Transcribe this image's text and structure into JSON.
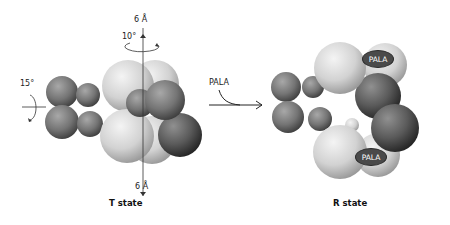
{
  "figure": {
    "t_state": {
      "caption": "T state",
      "top_translation_label": "6 Å",
      "bottom_translation_label": "6 Å",
      "vertical_rotation_label": "10°",
      "horizontal_rotation_label": "15°"
    },
    "transition": {
      "ligand_label": "PALA"
    },
    "r_state": {
      "caption": "R state",
      "bound_ligands": [
        "PALA",
        "PALA"
      ]
    },
    "colors": {
      "catalytic_light": "#d8d8d8",
      "regulatory_dark": "#6e6e6e",
      "badge": "#4a4a4a"
    }
  }
}
